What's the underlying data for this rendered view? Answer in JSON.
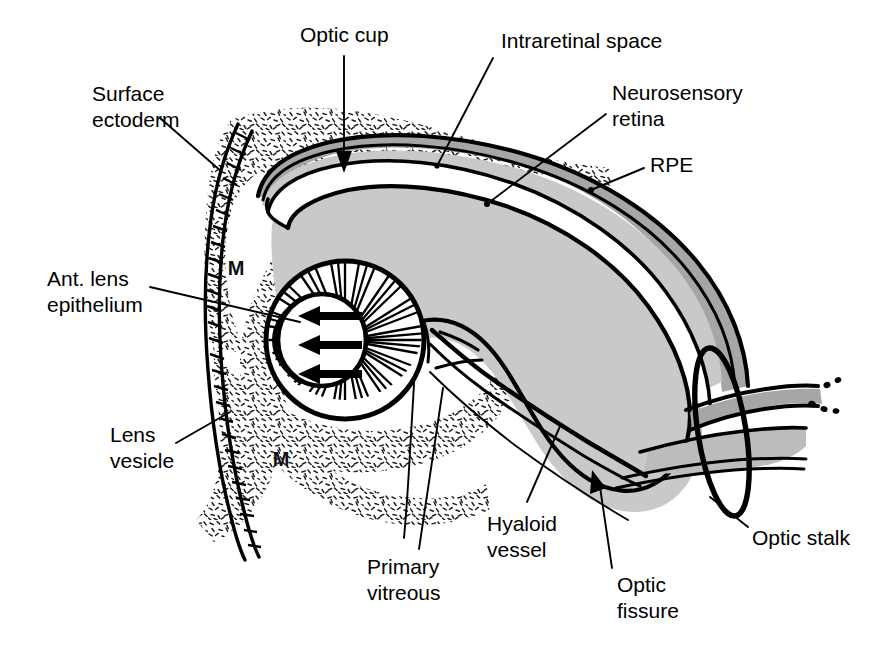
{
  "figure": {
    "width": 887,
    "height": 647,
    "background": "#ffffff"
  },
  "colors": {
    "ink": "#000000",
    "background": "#ffffff",
    "neurosensory_retina_fill": "#c9c9c9",
    "rpe_fill": "#a6a6a6",
    "intraretinal_space_fill": "#ffffff",
    "lens_lumen_fill": "#ffffff",
    "mesenchyme_stipple": "#1a1a1a"
  },
  "labels": [
    {
      "id": "optic-cup",
      "text": "Optic cup",
      "lines": [
        "Optic cup"
      ],
      "x": 300,
      "y": 42,
      "anchor": "start"
    },
    {
      "id": "intraretinal-space",
      "text": "Intraretinal space",
      "lines": [
        "Intraretinal space"
      ],
      "x": 501,
      "y": 48,
      "anchor": "start"
    },
    {
      "id": "neurosensory-retina",
      "text": "Neurosensory retina",
      "lines": [
        "Neurosensory",
        "retina"
      ],
      "x": 612,
      "y": 100,
      "anchor": "start"
    },
    {
      "id": "rpe",
      "text": "RPE",
      "lines": [
        "RPE"
      ],
      "x": 650,
      "y": 172,
      "anchor": "start"
    },
    {
      "id": "surface-ectoderm",
      "text": "Surface ectoderm",
      "lines": [
        "Surface",
        "ectoderm"
      ],
      "x": 92,
      "y": 101,
      "anchor": "start"
    },
    {
      "id": "ant-lens-epithelium",
      "text": "Ant. lens epithelium",
      "lines": [
        "Ant. lens",
        "epithelium"
      ],
      "x": 47,
      "y": 286,
      "anchor": "start"
    },
    {
      "id": "lens-vesicle",
      "text": "Lens vesicle",
      "lines": [
        "Lens",
        "vesicle"
      ],
      "x": 110,
      "y": 442,
      "anchor": "start"
    },
    {
      "id": "primary-vitreous",
      "text": "Primary vitreous",
      "lines": [
        "Primary",
        "vitreous"
      ],
      "x": 367,
      "y": 574,
      "anchor": "start"
    },
    {
      "id": "hyaloid-vessel",
      "text": "Hyaloid vessel",
      "lines": [
        "Hyaloid",
        "vessel"
      ],
      "x": 487,
      "y": 531,
      "anchor": "start"
    },
    {
      "id": "optic-fissure",
      "text": "Optic fissure",
      "lines": [
        "Optic",
        "fissure"
      ],
      "x": 617,
      "y": 592,
      "anchor": "start"
    },
    {
      "id": "optic-stalk",
      "text": "Optic stalk",
      "lines": [
        "Optic stalk"
      ],
      "x": 752,
      "y": 545,
      "anchor": "start"
    }
  ],
  "inline_labels": [
    {
      "id": "mesenchyme-upper",
      "text": "M",
      "x": 236,
      "y": 275
    },
    {
      "id": "mesenchyme-lower",
      "text": "M",
      "x": 281,
      "y": 466
    }
  ],
  "structures": [
    {
      "id": "optic-cup",
      "name": "Optic cup"
    },
    {
      "id": "neurosensory-retina",
      "name": "Neurosensory retina"
    },
    {
      "id": "rpe",
      "name": "Retinal pigment epithelium"
    },
    {
      "id": "intraretinal-space",
      "name": "Intraretinal space"
    },
    {
      "id": "surface-ectoderm",
      "name": "Surface ectoderm"
    },
    {
      "id": "lens-vesicle",
      "name": "Lens vesicle"
    },
    {
      "id": "ant-lens-epithelium",
      "name": "Anterior lens epithelium"
    },
    {
      "id": "mesenchyme",
      "name": "Mesenchyme"
    },
    {
      "id": "primary-vitreous",
      "name": "Primary vitreous"
    },
    {
      "id": "hyaloid-vessel",
      "name": "Hyaloid vessel"
    },
    {
      "id": "optic-fissure",
      "name": "Optic fissure"
    },
    {
      "id": "optic-stalk",
      "name": "Optic stalk"
    }
  ],
  "lens_fiber_arrows": {
    "count": 3,
    "direction": "left",
    "meaning": "elongation of posterior lens fibers toward anterior epithelium"
  }
}
